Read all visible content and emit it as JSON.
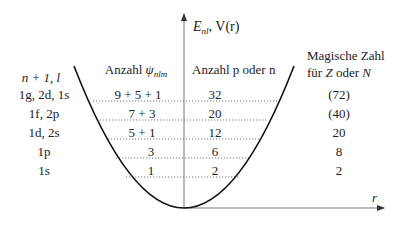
{
  "axes": {
    "y_label_main": "E",
    "y_label_sub": "nl",
    "y_label_rest": ", V(r)",
    "x_label": "r"
  },
  "headers": {
    "levels": "n + 1, l",
    "states_prefix": "Anzahl ",
    "states_psi": "ψ",
    "states_sub": "nlm",
    "count": "Anzahl p oder n",
    "magic_line1": "Magische Zahl",
    "magic_line2_prefix": "für ",
    "magic_line2_Z": "Z",
    "magic_line2_mid": " oder ",
    "magic_line2_N": "N"
  },
  "rows": [
    {
      "levels": "1g, 2d, 1s",
      "states": "9 + 5 + 1",
      "count": "32",
      "magic": "(72)"
    },
    {
      "levels": "1f, 2p",
      "states": "7 + 3",
      "count": "20",
      "magic": "(40)"
    },
    {
      "levels": "1d, 2s",
      "states": "5 + 1",
      "count": "12",
      "magic": "20"
    },
    {
      "levels": "1p",
      "states": "3",
      "count": "6",
      "magic": "8"
    },
    {
      "levels": "1s",
      "states": "1",
      "count": "2",
      "magic": "2"
    }
  ]
}
